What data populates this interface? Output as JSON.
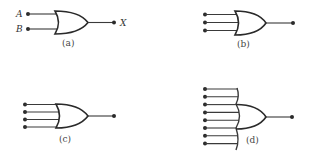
{
  "diagram": {
    "colors": {
      "stroke": "#2a2a2a",
      "background": "#ffffff",
      "label": "#444444"
    },
    "gates": [
      {
        "id": "a",
        "type": "OR",
        "caption": "(a)",
        "inputs": 2,
        "input_labels": [
          "A",
          "B"
        ],
        "output_label": "X"
      },
      {
        "id": "b",
        "type": "OR",
        "caption": "(b)",
        "inputs": 3
      },
      {
        "id": "c",
        "type": "OR",
        "caption": "(c)",
        "inputs": 4
      },
      {
        "id": "d",
        "type": "OR",
        "caption": "(d)",
        "inputs": 8,
        "extended_input_line": true
      }
    ]
  }
}
